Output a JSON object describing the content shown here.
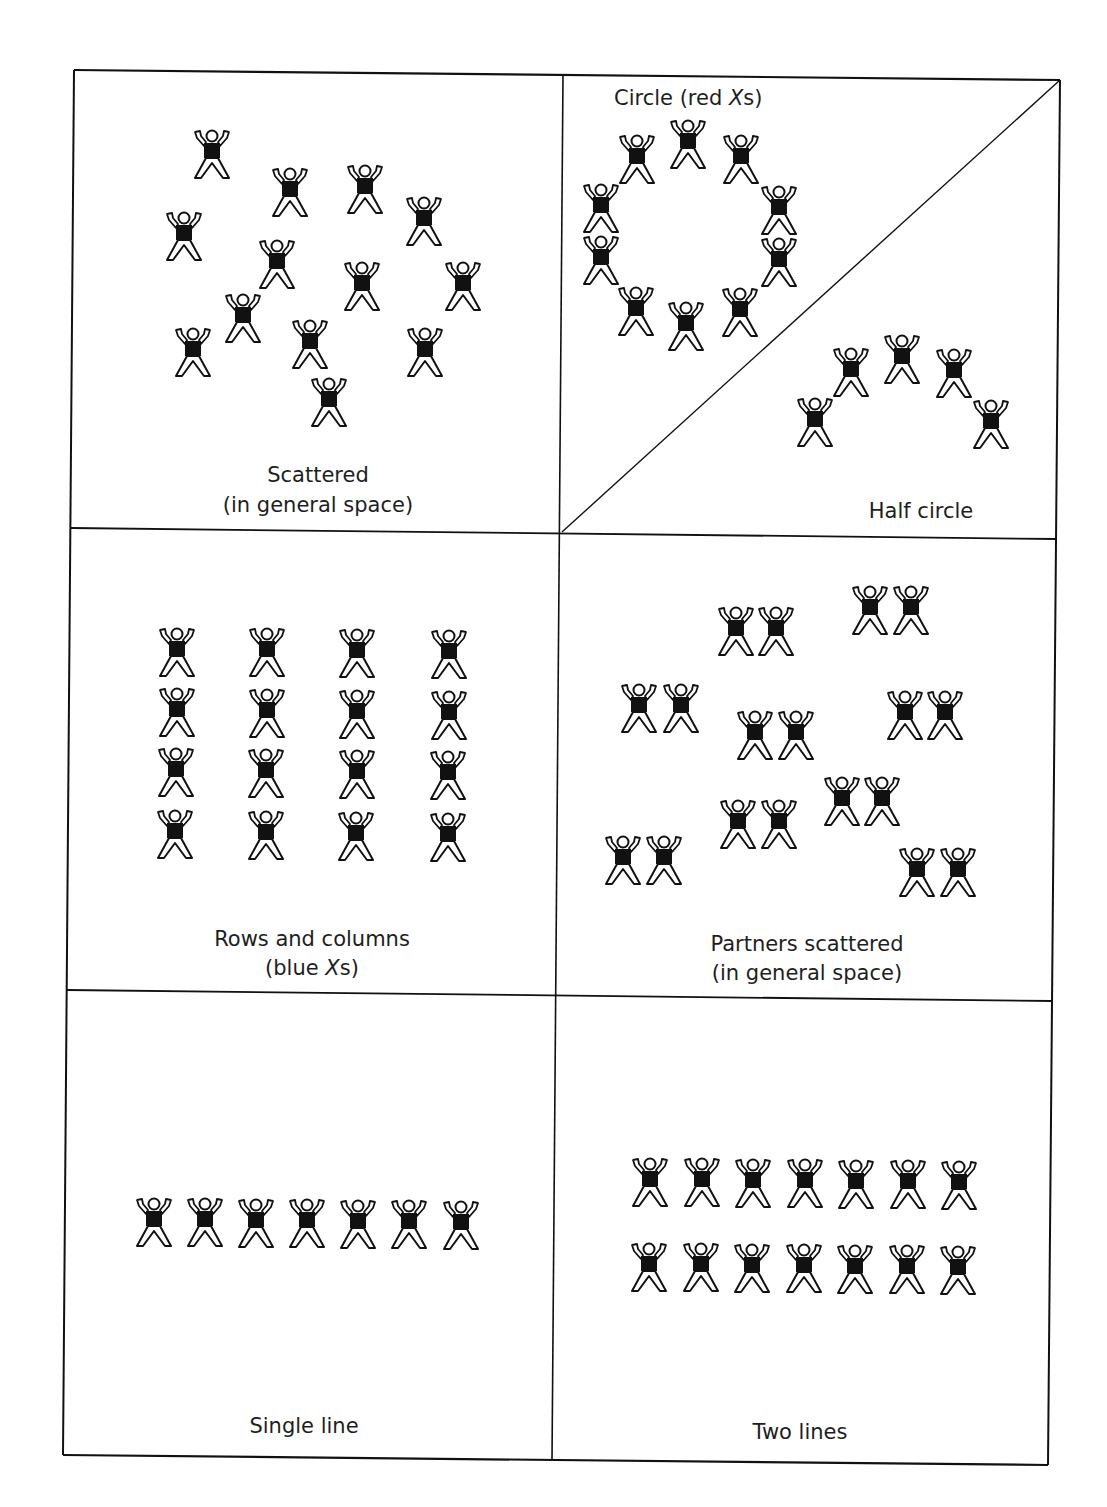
{
  "diagram": {
    "type": "formation-chart",
    "figure_icon": "person-arms-raised-icon",
    "line_color": "#111111",
    "cells": [
      {
        "id": "scattered",
        "caption_lines": [
          "Scattered",
          "(in general space)"
        ],
        "figure_count": 13
      },
      {
        "id": "circle",
        "caption_prefix": "Circle (red ",
        "caption_italic": "X",
        "caption_suffix": "s)",
        "figure_count": 10
      },
      {
        "id": "half-circle",
        "caption_lines": [
          "Half circle"
        ],
        "figure_count": 5
      },
      {
        "id": "rows-and-columns",
        "caption_lines": [
          "Rows and columns"
        ],
        "caption2_prefix": "(blue ",
        "caption2_italic": "X",
        "caption2_suffix": "s)",
        "rows": 4,
        "columns": 4,
        "figure_count": 16
      },
      {
        "id": "partners-scattered",
        "caption_lines": [
          "Partners scattered",
          "(in general space)"
        ],
        "pairs": 8,
        "figure_count": 16
      },
      {
        "id": "single-line",
        "caption_lines": [
          "Single line"
        ],
        "figure_count": 7
      },
      {
        "id": "two-lines",
        "caption_lines": [
          "Two lines"
        ],
        "rows": 2,
        "per_row": 7,
        "figure_count": 14
      }
    ]
  }
}
